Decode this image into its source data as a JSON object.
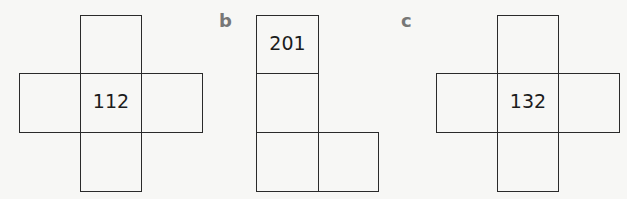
{
  "figures": [
    {
      "label": "",
      "center_value": "112",
      "shape": "cross"
    },
    {
      "label": "b",
      "center_value": "201",
      "shape": "L"
    },
    {
      "label": "c",
      "center_value": "132",
      "shape": "cross"
    }
  ]
}
